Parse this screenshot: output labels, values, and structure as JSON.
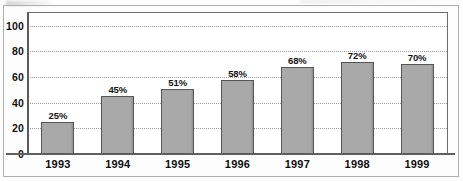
{
  "chart_data": {
    "type": "bar",
    "title": "",
    "subtitle": "",
    "xlabel": "",
    "ylabel": "",
    "categories": [
      "1993",
      "1994",
      "1995",
      "1996",
      "1997",
      "1998",
      "1999"
    ],
    "values": [
      25,
      45,
      51,
      58,
      68,
      72,
      70
    ],
    "data_labels": [
      "25%",
      "45%",
      "51%",
      "58%",
      "68%",
      "72%",
      "70%"
    ],
    "ylim": [
      0,
      110
    ],
    "yticks": [
      0,
      20,
      40,
      60,
      80,
      100
    ],
    "ytick_labels": [
      "0",
      "20",
      "40",
      "60",
      "80",
      "100"
    ],
    "grid": "horizontal-dotted",
    "legend": "none",
    "series": [
      {
        "name": "Percent",
        "values": [
          25,
          45,
          51,
          58,
          68,
          72,
          70
        ]
      }
    ],
    "colors": {
      "bar_fill": "#a9a9a9",
      "bar_border": "#575757",
      "gridline": "#9a9a9a",
      "axis": "#5a5a5a",
      "plot_border": "#6d6d6d",
      "outer_border": "#aeaeae",
      "text": "#111111",
      "background": "#ffffff"
    }
  }
}
